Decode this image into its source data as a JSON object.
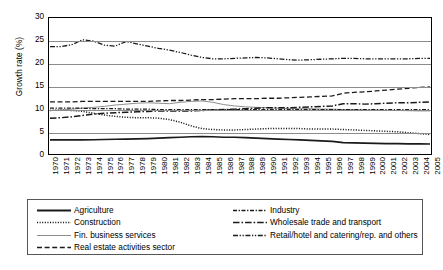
{
  "chart_data": {
    "type": "line",
    "title": "",
    "xlabel": "",
    "ylabel": "Growth rate (%)",
    "ylim": [
      0,
      30
    ],
    "ytick_values": [
      30,
      25,
      20,
      15,
      10,
      5,
      0
    ],
    "grid": "horizontal",
    "legend_position": "bottom",
    "x": [
      1970,
      1971,
      1972,
      1973,
      1974,
      1975,
      1976,
      1977,
      1978,
      1979,
      1980,
      1981,
      1982,
      1983,
      1984,
      1985,
      1986,
      1987,
      1988,
      1989,
      1990,
      1991,
      1992,
      1993,
      1994,
      1995,
      1996,
      1997,
      1998,
      1999,
      2000,
      2001,
      2002,
      2003,
      2004,
      2005
    ],
    "categories": [
      "1970",
      "1971",
      "1972",
      "1973",
      "1974",
      "1975",
      "1976",
      "1977",
      "1978",
      "1979",
      "1980",
      "1981",
      "1982",
      "1983",
      "1984",
      "1985",
      "1986",
      "1987",
      "1988",
      "1989",
      "1990",
      "1991",
      "1992",
      "1993",
      "1994",
      "1995",
      "1996",
      "1997",
      "1998",
      "1999",
      "2000",
      "2001",
      "2002",
      "2003",
      "2004",
      "2005"
    ],
    "series": [
      {
        "name": "Agriculture",
        "style": "solid-thick",
        "color": "#1a1a1a",
        "values": [
          3.1,
          3.1,
          3.1,
          3.1,
          3.15,
          3.2,
          3.25,
          3.3,
          3.35,
          3.4,
          3.5,
          3.6,
          3.7,
          3.8,
          3.85,
          3.8,
          3.7,
          3.7,
          3.6,
          3.5,
          3.4,
          3.3,
          3.2,
          3.1,
          3.0,
          2.9,
          2.8,
          2.5,
          2.45,
          2.4,
          2.35,
          2.3,
          2.3,
          2.25,
          2.25,
          2.2
        ]
      },
      {
        "name": "Construction",
        "style": "dotted",
        "color": "#1a1a1a",
        "values": [
          9.6,
          9.7,
          9.6,
          9.4,
          9.0,
          8.6,
          8.3,
          8.1,
          8.0,
          8.0,
          7.9,
          7.6,
          7.0,
          6.2,
          5.6,
          5.4,
          5.3,
          5.3,
          5.4,
          5.5,
          5.6,
          5.6,
          5.6,
          5.6,
          5.5,
          5.5,
          5.5,
          5.4,
          5.3,
          5.2,
          5.1,
          5.0,
          4.9,
          4.7,
          4.5,
          4.3
        ]
      },
      {
        "name": "Fin. business services",
        "style": "solid-thin-gray",
        "color": "#808080",
        "values": [
          9.6,
          9.7,
          9.9,
          10.1,
          10.3,
          10.5,
          10.8,
          11.0,
          11.2,
          11.3,
          11.2,
          11.1,
          11.4,
          11.6,
          11.7,
          11.4,
          10.9,
          10.6,
          10.4,
          10.3,
          10.2,
          10.1,
          10.0,
          10.0,
          10.0,
          9.9,
          9.9,
          9.8,
          9.8,
          9.7,
          9.7,
          9.6,
          9.6,
          9.55,
          9.5,
          9.5
        ]
      },
      {
        "name": "Real estate activities sector",
        "style": "dashed",
        "color": "#1a1a1a",
        "values": [
          11.5,
          11.5,
          11.5,
          11.6,
          11.6,
          11.6,
          11.6,
          11.6,
          11.6,
          11.6,
          11.7,
          11.8,
          11.8,
          11.9,
          12.0,
          12.0,
          12.1,
          12.2,
          12.2,
          12.2,
          12.3,
          12.3,
          12.4,
          12.5,
          12.6,
          12.7,
          12.8,
          13.4,
          13.6,
          13.7,
          13.9,
          14.1,
          14.3,
          14.5,
          14.7,
          14.8
        ]
      },
      {
        "name": "Industry",
        "style": "dashdot",
        "color": "#1a1a1a",
        "values": [
          10.1,
          10.1,
          10.1,
          10.1,
          10.0,
          10.0,
          10.0,
          9.9,
          9.9,
          9.9,
          9.8,
          9.8,
          9.8,
          9.8,
          9.8,
          9.8,
          9.8,
          9.8,
          9.8,
          9.8,
          9.8,
          9.8,
          9.8,
          9.8,
          9.8,
          9.8,
          9.8,
          9.8,
          9.8,
          9.8,
          9.8,
          9.8,
          9.8,
          9.8,
          9.8,
          9.8
        ]
      },
      {
        "name": "Wholesale trade and transport",
        "style": "longdash-dot",
        "color": "#1a1a1a",
        "values": [
          7.9,
          8.0,
          8.2,
          8.5,
          8.8,
          9.0,
          9.1,
          9.2,
          9.3,
          9.4,
          9.5,
          9.5,
          9.5,
          9.5,
          9.6,
          9.7,
          9.8,
          9.9,
          10.0,
          10.1,
          10.2,
          10.2,
          10.2,
          10.3,
          10.4,
          10.5,
          10.6,
          11.1,
          11.1,
          11.0,
          11.1,
          11.2,
          11.3,
          11.3,
          11.4,
          11.5
        ]
      },
      {
        "name": "Retail/hotel and catering/rep. and others",
        "style": "dashdotdot",
        "color": "#1a1a1a",
        "values": [
          23.7,
          23.7,
          24.1,
          25.2,
          24.9,
          24.0,
          23.8,
          24.8,
          24.3,
          23.8,
          23.3,
          22.9,
          22.4,
          21.8,
          21.3,
          21.0,
          21.0,
          21.1,
          21.2,
          21.3,
          21.2,
          21.0,
          20.8,
          20.7,
          20.8,
          20.9,
          21.0,
          21.1,
          21.1,
          21.0,
          21.0,
          21.0,
          21.0,
          21.0,
          21.1,
          21.1
        ]
      }
    ]
  },
  "legend": {
    "column1": [
      {
        "label": "Agriculture",
        "style": "solid-thick"
      },
      {
        "label": "Construction",
        "style": "dotted"
      },
      {
        "label": "Fin. business services",
        "style": "solid-thin-gray"
      },
      {
        "label": "Real estate activities sector",
        "style": "dashed"
      }
    ],
    "column2": [
      {
        "label": "Industry",
        "style": "dashdot"
      },
      {
        "label": "Wholesale trade and transport",
        "style": "longdash-dot"
      },
      {
        "label": "Retail/hotel and catering/rep. and others",
        "style": "dashdotdot"
      }
    ]
  }
}
